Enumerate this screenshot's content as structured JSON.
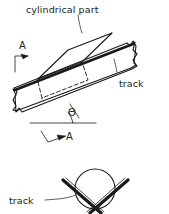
{
  "drawing": {
    "title_text": "Cylindrical part on inclined V-track",
    "background_color": "#ffffff",
    "line_color": "#1a1a1a"
  },
  "labels": {
    "cylindrical_part": "cylindrical part",
    "track_top": "track",
    "track_bottom": "track",
    "section_marker_top": "A",
    "section_marker_bottom": "A",
    "angle_symbol": "Θ"
  },
  "views": {
    "top": {
      "name": "inclined-track-view",
      "angle_label": "Θ",
      "section_label": "A"
    },
    "section": {
      "name": "section-a-a-view",
      "part_shape": "circle",
      "track_shape": "v-groove"
    }
  },
  "geometry": {
    "track_incline_deg": 21,
    "circle_center_x": 95,
    "circle_center_y": 189,
    "circle_radius": 20
  }
}
